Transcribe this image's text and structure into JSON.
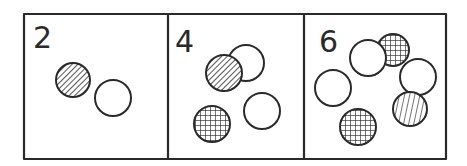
{
  "diagram": {
    "title": "",
    "stroke_color": "#2a2a2a",
    "background": "#ffffff",
    "outer_box": {
      "x": 24,
      "y": 14,
      "w": 422,
      "h": 145
    },
    "dividers": [
      168,
      304
    ],
    "panels": [
      {
        "label": "2",
        "count": 2,
        "label_pos": {
          "x": 33,
          "y": 48
        },
        "circles": [
          {
            "cx": 73,
            "cy": 80,
            "r": 17,
            "fill": "diagonal"
          },
          {
            "cx": 113,
            "cy": 98,
            "r": 18,
            "fill": "none"
          }
        ]
      },
      {
        "label": "4",
        "count": 4,
        "label_pos": {
          "x": 175,
          "y": 52
        },
        "circles": [
          {
            "cx": 246,
            "cy": 63,
            "r": 18,
            "fill": "none"
          },
          {
            "cx": 224,
            "cy": 73,
            "r": 18,
            "fill": "diagonal"
          },
          {
            "cx": 212,
            "cy": 124,
            "r": 18,
            "fill": "crosshatch"
          },
          {
            "cx": 262,
            "cy": 111,
            "r": 18,
            "fill": "none"
          }
        ]
      },
      {
        "label": "6",
        "count": 6,
        "label_pos": {
          "x": 319,
          "y": 52
        },
        "circles": [
          {
            "cx": 393,
            "cy": 50,
            "r": 16,
            "fill": "crosshatch"
          },
          {
            "cx": 368,
            "cy": 58,
            "r": 18,
            "fill": "none"
          },
          {
            "cx": 418,
            "cy": 77,
            "r": 18,
            "fill": "none"
          },
          {
            "cx": 333,
            "cy": 88,
            "r": 18,
            "fill": "none"
          },
          {
            "cx": 410,
            "cy": 109,
            "r": 17,
            "fill": "vertical"
          },
          {
            "cx": 358,
            "cy": 127,
            "r": 18,
            "fill": "crosshatch"
          }
        ]
      }
    ],
    "fill_types": [
      "none",
      "diagonal",
      "crosshatch",
      "vertical"
    ]
  }
}
